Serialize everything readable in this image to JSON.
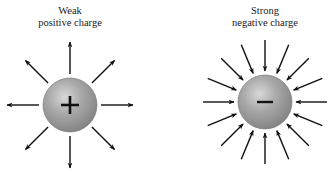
{
  "figure": {
    "background": "#ffffff",
    "sphere_color": "#9a9a9a",
    "sphere_highlight": "#d6d6d6",
    "arrow_color": "#111111"
  },
  "charges": [
    {
      "id": "positive",
      "label_line1": "Weak",
      "label_line2": "positive charge",
      "symbol": "+",
      "center": [
        70,
        105
      ],
      "radius": 27,
      "arrow_count": 8,
      "arrow_direction": "outward",
      "arrow_inner": 31,
      "arrow_outer": 63
    },
    {
      "id": "negative",
      "label_line1": "Strong",
      "label_line2": "negative charge",
      "symbol": "−",
      "center": [
        265,
        102
      ],
      "radius": 27,
      "arrow_count": 16,
      "arrow_direction": "inward",
      "arrow_inner": 31,
      "arrow_outer": 62
    }
  ]
}
